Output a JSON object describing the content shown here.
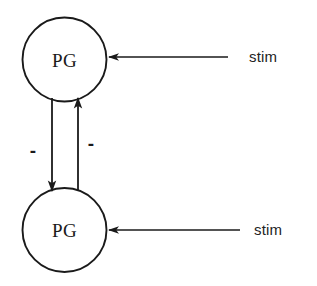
{
  "diagram": {
    "background_color": "#ffffff",
    "stroke_color": "#1a1a1a",
    "nodes": [
      {
        "id": "pg-top",
        "label": "PG",
        "cx": 64.5,
        "cy": 59.5,
        "r": 42.0,
        "stroke_width": 1.9
      },
      {
        "id": "pg-bottom",
        "label": "PG",
        "cx": 64.5,
        "cy": 230.0,
        "r": 42.0,
        "stroke_width": 1.9
      }
    ],
    "stim_inputs": [
      {
        "id": "stim-top",
        "label": "stim",
        "line_y": 57,
        "line_x_start": 228,
        "line_x_end": 109,
        "label_x": 249,
        "label_y": 62,
        "stroke_width": 1.6
      },
      {
        "id": "stim-bottom",
        "label": "stim",
        "line_y": 230,
        "line_x_start": 240,
        "line_x_end": 109,
        "label_x": 254,
        "label_y": 235,
        "stroke_width": 1.6
      }
    ],
    "connections": [
      {
        "id": "inhibit-downward",
        "from": "pg-top",
        "to": "pg-bottom",
        "x": 52,
        "y_start": 98,
        "y_end": 191,
        "direction": "down",
        "sign": "-",
        "sign_x": 33,
        "sign_y": 157,
        "stroke_width": 1.8
      },
      {
        "id": "inhibit-upward",
        "from": "pg-bottom",
        "to": "pg-top",
        "x": 78,
        "y_start": 191,
        "y_end": 98,
        "direction": "up",
        "sign": "-",
        "sign_x": 91,
        "sign_y": 150,
        "stroke_width": 1.8
      }
    ]
  }
}
